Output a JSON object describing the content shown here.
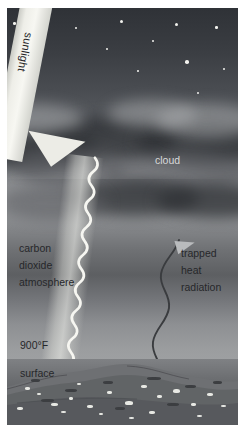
{
  "diagram": {
    "labels": {
      "sunlight": "sunlight",
      "cloud": "cloud",
      "atmosphere_line1": "carbon",
      "atmosphere_line2": "dioxide",
      "atmosphere_line3": "atmosphere",
      "trapped_line1": "trapped",
      "trapped_line2": "heat",
      "trapped_line3": "radiation",
      "temperature": "900°F",
      "surface": "surface"
    },
    "colors": {
      "sky_top": "#2f3237",
      "sky_mid": "#9a9c9e",
      "sky_low": "#a8aaac",
      "cloud_dark": "#303236",
      "beam": "#ecece6",
      "ground": "#6c6e71",
      "heat_line": "#3a3c3f"
    },
    "stars": [
      {
        "x": 6,
        "y": 14,
        "r": 1.3
      },
      {
        "x": 68,
        "y": 19,
        "r": 1.0
      },
      {
        "x": 113,
        "y": 12,
        "r": 1.6
      },
      {
        "x": 145,
        "y": 32,
        "r": 1.2
      },
      {
        "x": 168,
        "y": 15,
        "r": 1.5
      },
      {
        "x": 208,
        "y": 18,
        "r": 1.3
      },
      {
        "x": 178,
        "y": 52,
        "r": 1.8
      },
      {
        "x": 99,
        "y": 40,
        "r": 1.0
      },
      {
        "x": 216,
        "y": 60,
        "r": 1.1
      },
      {
        "x": 35,
        "y": 8,
        "r": 0.9
      },
      {
        "x": 190,
        "y": 84,
        "r": 1.0
      },
      {
        "x": 130,
        "y": 62,
        "r": 0.9
      }
    ],
    "clouds": [
      {
        "x": -30,
        "y": 118,
        "w": 120,
        "h": 44,
        "tone": "dark"
      },
      {
        "x": 40,
        "y": 108,
        "w": 130,
        "h": 48,
        "tone": "dark"
      },
      {
        "x": 130,
        "y": 112,
        "w": 140,
        "h": 46,
        "tone": "dark"
      },
      {
        "x": 8,
        "y": 140,
        "w": 110,
        "h": 40,
        "tone": "mid"
      },
      {
        "x": 96,
        "y": 144,
        "w": 150,
        "h": 42,
        "tone": "mid"
      },
      {
        "x": 150,
        "y": 96,
        "w": 100,
        "h": 34,
        "tone": "lite"
      },
      {
        "x": -20,
        "y": 96,
        "w": 96,
        "h": 30,
        "tone": "lite"
      },
      {
        "x": 62,
        "y": 172,
        "w": 130,
        "h": 36,
        "tone": "dark"
      },
      {
        "x": -10,
        "y": 178,
        "w": 110,
        "h": 34,
        "tone": "mid"
      },
      {
        "x": 150,
        "y": 176,
        "w": 120,
        "h": 34,
        "tone": "dark"
      },
      {
        "x": 100,
        "y": 92,
        "w": 90,
        "h": 28,
        "tone": "lite"
      }
    ],
    "specks": [
      {
        "x": 18,
        "y": 28,
        "w": 5,
        "h": 3
      },
      {
        "x": 30,
        "y": 34,
        "w": 4,
        "h": 2
      },
      {
        "x": 44,
        "y": 44,
        "w": 7,
        "h": 3
      },
      {
        "x": 62,
        "y": 38,
        "w": 4,
        "h": 3
      },
      {
        "x": 80,
        "y": 46,
        "w": 6,
        "h": 3
      },
      {
        "x": 100,
        "y": 32,
        "w": 5,
        "h": 3
      },
      {
        "x": 118,
        "y": 42,
        "w": 8,
        "h": 4
      },
      {
        "x": 134,
        "y": 26,
        "w": 6,
        "h": 3
      },
      {
        "x": 150,
        "y": 36,
        "w": 5,
        "h": 3
      },
      {
        "x": 166,
        "y": 30,
        "w": 7,
        "h": 4
      },
      {
        "x": 184,
        "y": 44,
        "w": 5,
        "h": 3
      },
      {
        "x": 200,
        "y": 34,
        "w": 6,
        "h": 3
      },
      {
        "x": 214,
        "y": 46,
        "w": 5,
        "h": 2
      },
      {
        "x": 10,
        "y": 48,
        "w": 6,
        "h": 3
      },
      {
        "x": 54,
        "y": 52,
        "w": 5,
        "h": 2
      },
      {
        "x": 92,
        "y": 54,
        "w": 4,
        "h": 2
      },
      {
        "x": 142,
        "y": 52,
        "w": 6,
        "h": 3
      },
      {
        "x": 190,
        "y": 56,
        "w": 5,
        "h": 2
      },
      {
        "x": 70,
        "y": 24,
        "w": 4,
        "h": 2
      },
      {
        "x": 122,
        "y": 58,
        "w": 5,
        "h": 2
      }
    ],
    "darkspecks": [
      {
        "x": 24,
        "y": 20,
        "w": 9,
        "h": 3
      },
      {
        "x": 58,
        "y": 30,
        "w": 12,
        "h": 3
      },
      {
        "x": 96,
        "y": 22,
        "w": 10,
        "h": 3
      },
      {
        "x": 140,
        "y": 18,
        "w": 14,
        "h": 3
      },
      {
        "x": 178,
        "y": 26,
        "w": 11,
        "h": 3
      },
      {
        "x": 206,
        "y": 22,
        "w": 9,
        "h": 3
      },
      {
        "x": 34,
        "y": 40,
        "w": 13,
        "h": 3
      },
      {
        "x": 108,
        "y": 48,
        "w": 10,
        "h": 3
      },
      {
        "x": 160,
        "y": 44,
        "w": 12,
        "h": 3
      }
    ]
  }
}
